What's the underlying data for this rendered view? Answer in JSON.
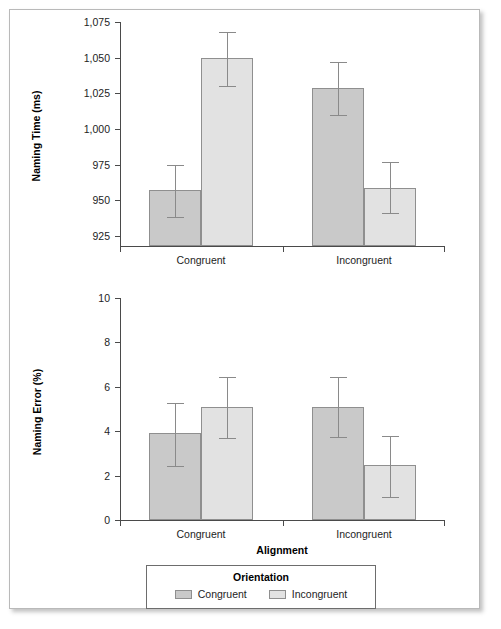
{
  "figure": {
    "legend": {
      "title": "Orientation",
      "entries": [
        {
          "label": "Congruent",
          "color": "#c9c9c9"
        },
        {
          "label": "Incongruent",
          "color": "#e2e2e2"
        }
      ]
    }
  },
  "chart_data": [
    {
      "type": "bar",
      "panel": "top",
      "title": "",
      "xlabel": "",
      "ylabel": "Naming Time (ms)",
      "categories": [
        "Congruent",
        "Incongruent"
      ],
      "ylim": [
        918,
        1075
      ],
      "yticks": [
        925,
        950,
        975,
        1000,
        1025,
        1050,
        1075
      ],
      "ytick_labels": [
        "925",
        "950",
        "975",
        "1,000",
        "1,025",
        "1,050",
        "1,075"
      ],
      "grid": false,
      "legend_position": "bottom",
      "series": [
        {
          "name": "Congruent",
          "color": "#c9c9c9",
          "values": [
            957,
            1029
          ],
          "error_low": [
            938,
            1010
          ],
          "error_high": [
            975,
            1047
          ]
        },
        {
          "name": "Incongruent",
          "color": "#e2e2e2",
          "values": [
            1050,
            959
          ],
          "error_low": [
            1030,
            941
          ],
          "error_high": [
            1068,
            977
          ]
        }
      ]
    },
    {
      "type": "bar",
      "panel": "bottom",
      "title": "",
      "xlabel": "Alignment",
      "ylabel": "Naming Error (%)",
      "categories": [
        "Congruent",
        "Incongruent"
      ],
      "ylim": [
        0,
        10
      ],
      "yticks": [
        0,
        2,
        4,
        6,
        8,
        10
      ],
      "ytick_labels": [
        "0",
        "2",
        "4",
        "6",
        "8",
        "10"
      ],
      "grid": false,
      "legend_position": "bottom",
      "series": [
        {
          "name": "Congruent",
          "color": "#c9c9c9",
          "values": [
            3.9,
            5.1
          ],
          "error_low": [
            2.45,
            3.75
          ],
          "error_high": [
            5.25,
            6.45
          ]
        },
        {
          "name": "Incongruent",
          "color": "#e2e2e2",
          "values": [
            5.1,
            2.5
          ],
          "error_low": [
            3.7,
            1.05
          ],
          "error_high": [
            6.45,
            3.8
          ]
        }
      ]
    }
  ]
}
